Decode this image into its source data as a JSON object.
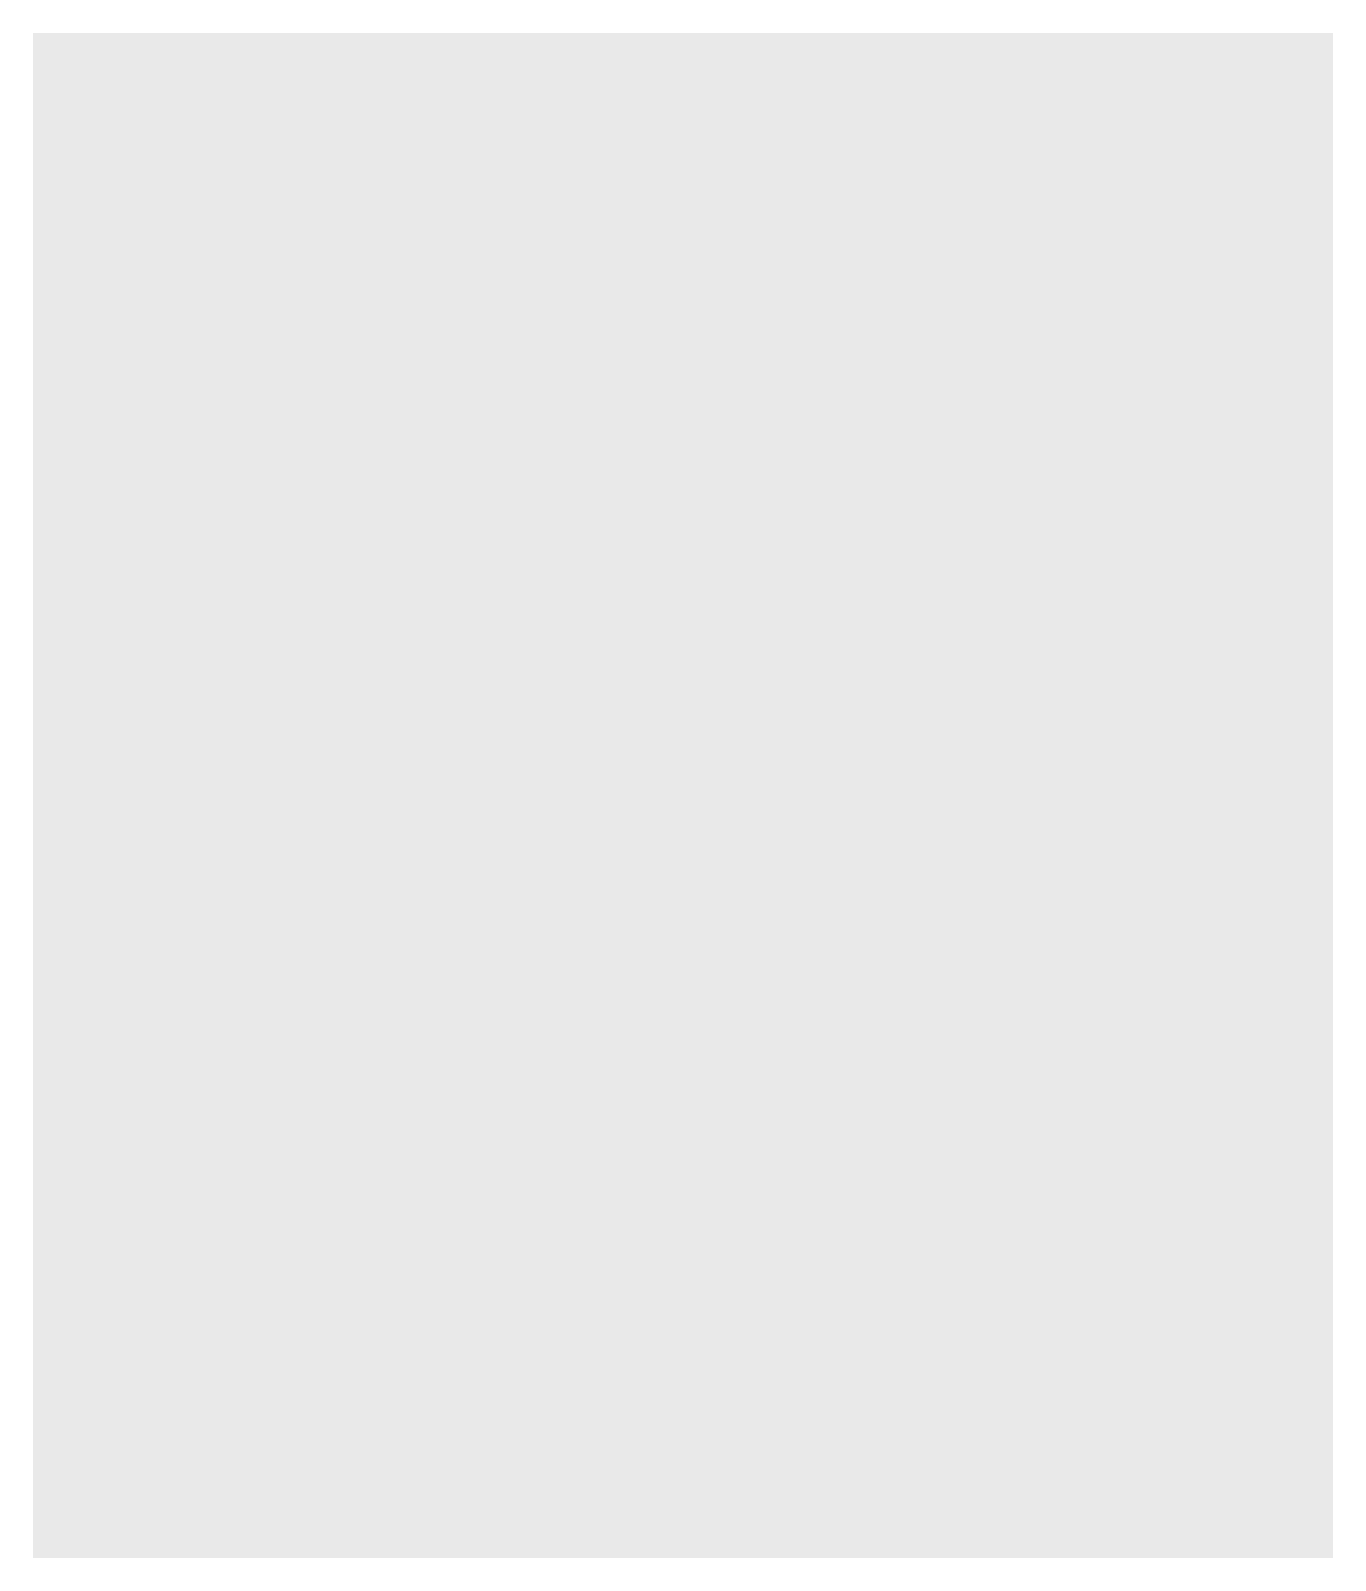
{
  "chart_data": {
    "type": "bar",
    "orientation": "horizontal",
    "grouped": true,
    "title": "",
    "xlabel": "Estimated Population",
    "ylabel": "",
    "xlim": [
      0,
      350000
    ],
    "xticks": [
      0,
      50000,
      100000,
      150000,
      200000,
      250000,
      300000,
      350000
    ],
    "xtick_labels": [
      "0",
      "50,000",
      "100,000",
      "150,000",
      "200,000",
      "250,000",
      "300,000",
      "350,000"
    ],
    "grid": true,
    "legend": {
      "position": "top-right",
      "entries": [
        {
          "name": "Black",
          "color": "#6f6f6f"
        },
        {
          "name": "White",
          "color": "#9a9a9a"
        }
      ]
    },
    "categories": [
      "British West Indies",
      "Lower South",
      "Chesapeake",
      "Middle Colonies",
      "New England"
    ],
    "panels": [
      {
        "title": "1650",
        "series": [
          {
            "name": "Black",
            "values": [
              15000,
              0,
              300,
              500,
              400
            ],
            "labels": [
              "15,000",
              "",
              "300",
              "500",
              "400"
            ]
          },
          {
            "name": "White",
            "values": [
              44000,
              0,
              12400,
              3800,
              22500
            ],
            "labels": [
              "44,000",
              "",
              "12,400",
              "3,800",
              "22,500"
            ]
          }
        ]
      },
      {
        "title": "1700",
        "series": [
          {
            "name": "Black",
            "values": [
              115000,
              2900,
              12900,
              3700,
              1700
            ],
            "labels": [
              "115,000",
              "2,900",
              "12,900",
              "3,700",
              "1,700"
            ]
          },
          {
            "name": "White",
            "values": [
              33000,
              13600,
              85200,
              49900,
              90700
            ],
            "labels": [
              "33,000",
              "13,600",
              "85,200",
              "49,900",
              "90,700"
            ]
          }
        ]
      },
      {
        "title": "1750",
        "series": [
          {
            "name": "Black",
            "values": [
              295000,
              59800,
              150600,
              20700,
              11000
            ],
            "labels": [
              "295,000",
              "59,800",
              "150,600",
              "20,700",
              "11,000"
            ]
          },
          {
            "name": "White",
            "values": [
              35000,
              82400,
              227200,
              275700,
              349000
            ],
            "labels": [
              "35,000",
              "82,400",
              "227,200",
              "275,700",
              "349,000"
            ]
          }
        ]
      }
    ]
  }
}
